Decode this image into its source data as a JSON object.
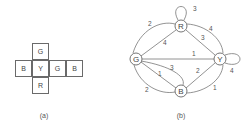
{
  "panel_a": {
    "caption": "(a)",
    "cells": [
      {
        "label": "G",
        "x": 32,
        "y": 43
      },
      {
        "label": "B",
        "x": 15,
        "y": 60
      },
      {
        "label": "Y",
        "x": 32,
        "y": 60
      },
      {
        "label": "G",
        "x": 49,
        "y": 60
      },
      {
        "label": "B",
        "x": 66,
        "y": 60
      },
      {
        "label": "R",
        "x": 32,
        "y": 77
      }
    ]
  },
  "panel_b": {
    "caption": "(b)",
    "nodes": {
      "R": {
        "label": "R",
        "x": 181,
        "y": 26
      },
      "G": {
        "label": "G",
        "x": 136,
        "y": 59
      },
      "Y": {
        "label": "Y",
        "x": 220,
        "y": 59
      },
      "B": {
        "label": "B",
        "x": 181,
        "y": 91
      }
    },
    "edges": [
      {
        "from": "R",
        "to": "R",
        "weight": "3"
      },
      {
        "from": "G",
        "to": "R",
        "weight": "2",
        "style": "outer-arc"
      },
      {
        "from": "G",
        "to": "R",
        "weight": "4",
        "style": "straight"
      },
      {
        "from": "R",
        "to": "Y",
        "weight": "4",
        "style": "outer-arc"
      },
      {
        "from": "R",
        "to": "Y",
        "weight": "3",
        "style": "straight"
      },
      {
        "from": "G",
        "to": "Y",
        "weight": "1",
        "style": "straight"
      },
      {
        "from": "Y",
        "to": "Y",
        "weight": "4"
      },
      {
        "from": "G",
        "to": "B",
        "weight": "1",
        "style": "straight"
      },
      {
        "from": "G",
        "to": "B",
        "weight": "3",
        "style": "inner-arc"
      },
      {
        "from": "G",
        "to": "B",
        "weight": "2",
        "style": "outer-arc"
      },
      {
        "from": "B",
        "to": "Y",
        "weight": "2",
        "style": "straight"
      },
      {
        "from": "B",
        "to": "Y",
        "weight": "1",
        "style": "outer-arc"
      }
    ]
  }
}
